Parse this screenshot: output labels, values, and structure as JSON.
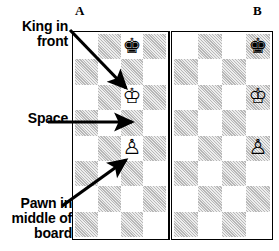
{
  "figure": {
    "type": "chess-diagram-pair",
    "column_labels": {
      "left": "A",
      "right": "B"
    }
  },
  "annotations": [
    {
      "id": "king-in-front",
      "text": "King in\nfront"
    },
    {
      "id": "space",
      "text": "Space"
    },
    {
      "id": "pawn-middle",
      "text": "Pawn in\nmiddle of\nboard"
    }
  ],
  "boards": [
    {
      "id": "board-a",
      "label": "A",
      "columns": 4,
      "rows": 8,
      "pieces": [
        {
          "row": 0,
          "col": 2,
          "glyph": "♚",
          "name": "black-king"
        },
        {
          "row": 2,
          "col": 2,
          "glyph": "♔",
          "name": "white-king"
        },
        {
          "row": 4,
          "col": 2,
          "glyph": "♙",
          "name": "white-pawn"
        }
      ]
    },
    {
      "id": "board-b",
      "label": "B",
      "columns": 4,
      "rows": 8,
      "pieces": [
        {
          "row": 0,
          "col": 3,
          "glyph": "♚",
          "name": "black-king"
        },
        {
          "row": 2,
          "col": 3,
          "glyph": "♔",
          "name": "white-king"
        },
        {
          "row": 4,
          "col": 3,
          "glyph": "♙",
          "name": "white-pawn"
        }
      ]
    }
  ],
  "colors": {
    "dark_square": "#b8b8b8",
    "light_square": "#ffffff",
    "ink": "#000000"
  }
}
